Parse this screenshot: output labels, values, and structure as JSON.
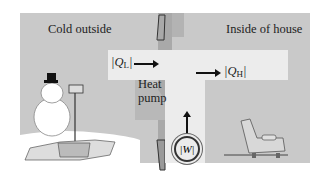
{
  "regions": {
    "outside_label": "Cold outside",
    "inside_label": "Inside of house"
  },
  "heat_pump": {
    "label_line1": "Heat",
    "label_line2": "pump",
    "q_low": {
      "prefix": "|Q",
      "sub": "L",
      "suffix": "|"
    },
    "q_high": {
      "prefix": "|Q",
      "sub": "H",
      "suffix": "|"
    },
    "work": "|W|"
  },
  "colors": {
    "background": "#c9c9c9",
    "pump_body": "#ececec",
    "wall": "#a9a9a9"
  }
}
